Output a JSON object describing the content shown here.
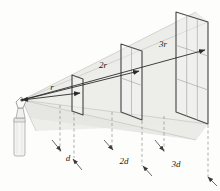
{
  "figure": {
    "background_color": "#fdfdfc",
    "ink_color": "#333333",
    "cone_fill_color": "#e9e9e7",
    "panel_frame_color": "#4a4a4a",
    "grid_line_color": "#9a9a9a",
    "dashed_line_color": "#8a8a8a",
    "lamp_body_color": "#f2f2f0"
  },
  "source": {
    "name": "light-source-lamp",
    "label": ""
  },
  "radius_labels": [
    {
      "id": "r1",
      "text": "r",
      "x": 52,
      "y": 90
    },
    {
      "id": "r2",
      "text": "2r",
      "x": 100,
      "y": 67
    },
    {
      "id": "r3",
      "text": "3r",
      "x": 160,
      "y": 46
    }
  ],
  "distance_labels": [
    {
      "id": "d1",
      "text": "d",
      "x": 68,
      "y": 160
    },
    {
      "id": "d2",
      "text": "2d",
      "x": 122,
      "y": 163
    },
    {
      "id": "d3",
      "text": "3d",
      "x": 172,
      "y": 165
    }
  ],
  "panels": [
    {
      "id": "panel-1",
      "grid": 1,
      "size_label": "r",
      "distance_label": "d"
    },
    {
      "id": "panel-2",
      "grid": 2,
      "size_label": "2r",
      "distance_label": "2d"
    },
    {
      "id": "panel-3",
      "grid": 3,
      "size_label": "3r",
      "distance_label": "3d"
    }
  ]
}
